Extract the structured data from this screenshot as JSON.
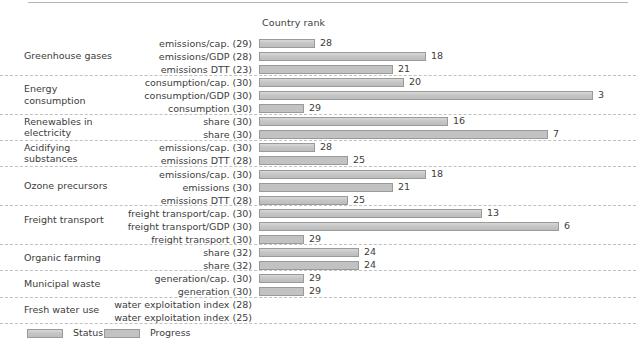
{
  "header": {
    "column_title": "Country rank"
  },
  "legend": {
    "status_label": "Status",
    "progress_label": "Progress"
  },
  "colors": {
    "status_fill": "#c6c6c6",
    "progress_fill": "#c2c2c2",
    "bar_border": "#9a9a9a",
    "separator": "#c0c0c0",
    "text": "#3c3c3c",
    "background": "#ffffff"
  },
  "chart_data": {
    "type": "bar",
    "title": "",
    "xlabel": "Country rank",
    "ylabel": "",
    "orientation": "horizontal",
    "xlim": [
      32,
      1
    ],
    "grid": false,
    "legend_position": "bottom-left",
    "note": "Bar length is inverse to rank: rank 1 = longest bar, rank 32 = shortest bar.",
    "series": [
      {
        "name": "Status",
        "style": "solid-fill"
      },
      {
        "name": "Progress",
        "style": "chevron-hatched"
      }
    ],
    "groups": [
      {
        "name": "Greenhouse gases",
        "rows": [
          {
            "label": "emissions/cap. (29)",
            "indicator": "emissions/cap.",
            "total": 29,
            "series": "Status",
            "value": 28
          },
          {
            "label": "emissions/GDP (28)",
            "indicator": "emissions/GDP",
            "total": 28,
            "series": "Status",
            "value": 18
          },
          {
            "label": "emissions DTT (23)",
            "indicator": "emissions DTT",
            "total": 23,
            "series": "Progress",
            "value": 21
          }
        ]
      },
      {
        "name": "Energy consumption",
        "rows": [
          {
            "label": "consumption/cap. (30)",
            "indicator": "consumption/cap.",
            "total": 30,
            "series": "Status",
            "value": 20
          },
          {
            "label": "consumption/GDP (30)",
            "indicator": "consumption/GDP",
            "total": 30,
            "series": "Status",
            "value": 3
          },
          {
            "label": "consumption (30)",
            "indicator": "consumption",
            "total": 30,
            "series": "Progress",
            "value": 29
          }
        ]
      },
      {
        "name": "Renewables in electricity",
        "rows": [
          {
            "label": "share (30)",
            "indicator": "share",
            "total": 30,
            "series": "Status",
            "value": 16
          },
          {
            "label": "share (30)",
            "indicator": "share",
            "total": 30,
            "series": "Progress",
            "value": 7
          }
        ]
      },
      {
        "name": "Acidifying substances",
        "rows": [
          {
            "label": "emissions/cap. (30)",
            "indicator": "emissions/cap.",
            "total": 30,
            "series": "Status",
            "value": 28
          },
          {
            "label": "emissions DTT (28)",
            "indicator": "emissions DTT",
            "total": 28,
            "series": "Progress",
            "value": 25
          }
        ]
      },
      {
        "name": "Ozone precursors",
        "rows": [
          {
            "label": "emissions/cap. (30)",
            "indicator": "emissions/cap.",
            "total": 30,
            "series": "Status",
            "value": 18
          },
          {
            "label": "emissions (30)",
            "indicator": "emissions",
            "total": 30,
            "series": "Progress",
            "value": 21
          },
          {
            "label": "emissions DTT (28)",
            "indicator": "emissions DTT",
            "total": 28,
            "series": "Status",
            "value": 25
          }
        ]
      },
      {
        "name": "Freight transport",
        "rows": [
          {
            "label": "freight transport/cap. (30)",
            "indicator": "freight transport/cap.",
            "total": 30,
            "series": "Status",
            "value": 13
          },
          {
            "label": "freight transport/GDP (30)",
            "indicator": "freight transport/GDP",
            "total": 30,
            "series": "Status",
            "value": 6
          },
          {
            "label": "freight transport (30)",
            "indicator": "freight transport",
            "total": 30,
            "series": "Progress",
            "value": 29
          }
        ]
      },
      {
        "name": "Organic farming",
        "rows": [
          {
            "label": "share (32)",
            "indicator": "share",
            "total": 32,
            "series": "Status",
            "value": 24
          },
          {
            "label": "share (32)",
            "indicator": "share",
            "total": 32,
            "series": "Progress",
            "value": 24
          }
        ]
      },
      {
        "name": "Municipal waste",
        "rows": [
          {
            "label": "generation/cap. (30)",
            "indicator": "generation/cap.",
            "total": 30,
            "series": "Status",
            "value": 29
          },
          {
            "label": "generation (30)",
            "indicator": "generation",
            "total": 30,
            "series": "Progress",
            "value": 29
          }
        ]
      },
      {
        "name": "Fresh water use",
        "rows": [
          {
            "label": "water exploitation index (28)",
            "indicator": "water exploitation index",
            "total": 28,
            "series": "Status",
            "value": null
          },
          {
            "label": "water exploitation index (25)",
            "indicator": "water exploitation index",
            "total": 25,
            "series": "Progress",
            "value": null
          }
        ]
      }
    ]
  }
}
